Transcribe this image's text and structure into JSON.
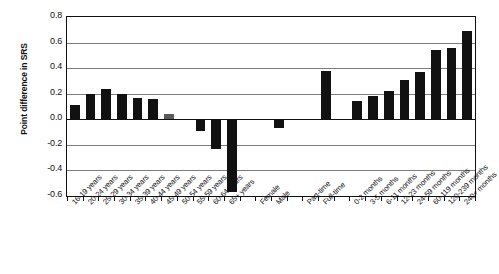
{
  "chart_data": {
    "type": "bar",
    "title": "",
    "subtitle": "",
    "xlabel": "",
    "ylabel": "Point difference in SRS",
    "ylim": [
      -0.6,
      0.8
    ],
    "ytick_values": [
      0.8,
      0.6,
      0.4,
      0.2,
      0.0,
      -0.2,
      -0.4,
      -0.6
    ],
    "ytick_labels": [
      "0.8",
      "0.6",
      "0.4",
      "0.2",
      "0.0",
      "-0.2",
      "-0.4",
      "-0.6"
    ],
    "grid": true,
    "legend": "none",
    "categories": [
      "16-19 years",
      "20-24 years",
      "25-29 years",
      "30-34 years",
      "35-39 years",
      "40-44 years",
      "45-49 years",
      "50-54 years",
      "55-59 years",
      "60-64 years",
      "65+ years",
      "Female",
      "Male",
      "Part-time",
      "Full-time",
      "0-2 months",
      "3-5 months",
      "6-11 months",
      "12-23 months",
      "24-59 months",
      "60-119 months",
      "120-239 months",
      "240+ months"
    ],
    "values": [
      0.11,
      0.2,
      0.24,
      0.2,
      0.17,
      0.16,
      0.04,
      0.0,
      -0.09,
      -0.23,
      -0.57,
      0.0,
      -0.07,
      0.0,
      0.38,
      0.14,
      0.18,
      0.22,
      0.31,
      0.37,
      0.54,
      0.56,
      0.69
    ],
    "bar_colors": [
      "#111111",
      "#111111",
      "#111111",
      "#111111",
      "#111111",
      "#111111",
      "#5b5b5b",
      "#111111",
      "#111111",
      "#111111",
      "#111111",
      "#111111",
      "#111111",
      "#111111",
      "#111111",
      "#111111",
      "#111111",
      "#111111",
      "#111111",
      "#111111",
      "#111111",
      "#111111",
      "#111111"
    ],
    "group_breaks_after": [
      10,
      12,
      14
    ],
    "accent_color": "#111111",
    "grid_color": "#7d7d7d",
    "axis_color": "#111111",
    "background": "#ffffff"
  }
}
